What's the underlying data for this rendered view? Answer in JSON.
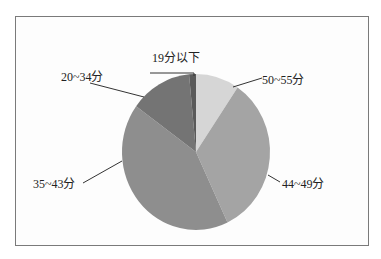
{
  "chart_data": {
    "type": "pie",
    "title": "",
    "order": "clockwise from 12 o'clock",
    "categories": [
      "50~55分",
      "44~49分",
      "35~43分",
      "20~34分",
      "19分以下"
    ],
    "values": [
      9.5,
      33.5,
      42.0,
      13.5,
      1.5
    ],
    "unit": "percent (estimated from slice angles)",
    "colors": [
      "#d6d6d6",
      "#a4a4a4",
      "#8e8e8e",
      "#747474",
      "#5a5a5a"
    ],
    "legend": "none (leader-line labels)"
  },
  "labels": {
    "s50_55": "50~55分",
    "s44_49": "44~49分",
    "s35_43": "35~43分",
    "s20_34": "20~34分",
    "s19": "19分以下"
  }
}
